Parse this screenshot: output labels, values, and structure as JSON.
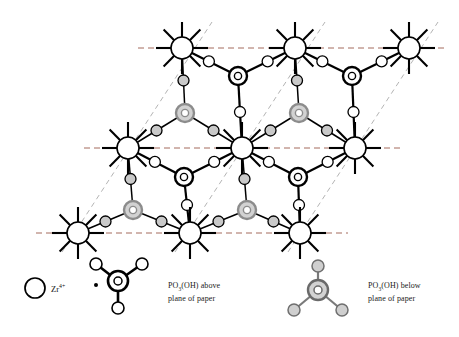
{
  "figure": {
    "title": "",
    "type": "crystal-structure-diagram"
  },
  "legend": {
    "zr": {
      "symbol_main": "Zr",
      "symbol_sup": "4+",
      "icon": "open-circle-icon",
      "name": "zirconium-ion"
    },
    "above": {
      "line1": "PO",
      "line1_sub": "3",
      "line1_rest": "(OH) above",
      "line2": "plane of paper",
      "icon": "phosphate-above-icon"
    },
    "below": {
      "line1": "PO",
      "line1_sub": "3",
      "line1_rest": "(OH) below",
      "line2": "plane of paper",
      "icon": "phosphate-below-icon"
    }
  },
  "colors": {
    "stroke": "#000000",
    "zr_fill": "#ffffff",
    "oxygen_above_fill": "#ffffff",
    "oxygen_below_fill": "#c9c9c9",
    "p_above_ring": "#000000",
    "p_below_ring": "#8c8c8c",
    "p_below_fill": "#d2d2d2",
    "dash_horizontal": "#9a5a4a",
    "dash_diagonal": "#aaaaaa",
    "background": "#ffffff"
  },
  "lattice": {
    "zr_rows": [
      {
        "y": 48,
        "x": [
          182,
          295,
          409
        ],
        "name": "zr-row-top"
      },
      {
        "y": 148,
        "x": [
          128,
          242,
          355
        ],
        "name": "zr-row-middle"
      },
      {
        "y": 233,
        "x": [
          78,
          190,
          300
        ],
        "name": "zr-row-bottom"
      }
    ],
    "zr_radius": 11,
    "zr_spokes": 8,
    "zr_spoke_length": 15,
    "oxygen_radius": 5.5,
    "p_outer_radius": 9,
    "p_inner_radius": 3.6,
    "phosphate_above_centers": [
      {
        "x": 238,
        "y": 76
      },
      {
        "x": 352,
        "y": 76
      },
      {
        "x": 184,
        "y": 177
      },
      {
        "x": 298,
        "y": 177
      }
    ],
    "phosphate_below_centers": [
      {
        "x": 185,
        "y": 113
      },
      {
        "x": 299,
        "y": 113
      },
      {
        "x": 133,
        "y": 210
      },
      {
        "x": 247,
        "y": 210
      }
    ],
    "dashed_horizontal_lines": [
      {
        "y": 48,
        "x1": 138,
        "x2": 448
      },
      {
        "y": 148,
        "x1": 84,
        "x2": 400
      },
      {
        "y": 233,
        "x1": 36,
        "x2": 348
      }
    ],
    "dashed_diagonal_lines": [
      {
        "x1": 62,
        "y1": 252,
        "x2": 212,
        "y2": 22
      },
      {
        "x1": 175,
        "y1": 252,
        "x2": 325,
        "y2": 22
      },
      {
        "x1": 288,
        "y1": 252,
        "x2": 438,
        "y2": 22
      }
    ]
  },
  "legend_icons": {
    "above_molecule": {
      "center": {
        "x": 118,
        "y": 281
      },
      "oxygens": [
        {
          "x": 96,
          "y": 264,
          "fill": "#ffffff"
        },
        {
          "x": 142,
          "y": 264,
          "fill": "#ffffff"
        },
        {
          "x": 118,
          "y": 308,
          "fill": "#ffffff"
        }
      ],
      "dot": {
        "x": 96,
        "y": 285
      }
    },
    "below_molecule": {
      "center": {
        "x": 318,
        "y": 290
      },
      "oxygens": [
        {
          "x": 318,
          "y": 266,
          "fill": "#cfcfcf"
        },
        {
          "x": 294,
          "y": 310,
          "fill": "#cfcfcf"
        },
        {
          "x": 342,
          "y": 310,
          "fill": "#cfcfcf"
        }
      ]
    },
    "zr_circle": {
      "x": 35,
      "y": 288,
      "r": 10
    }
  }
}
